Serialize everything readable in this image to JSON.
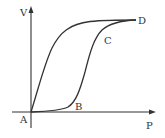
{
  "diagram": {
    "axes": {
      "x_label": "P",
      "y_label": "V"
    },
    "points": [
      {
        "label": "A",
        "role": "origin"
      },
      {
        "label": "B",
        "role": "lower curve knee"
      },
      {
        "label": "C",
        "role": "lower curve upper bend"
      },
      {
        "label": "D",
        "role": "meeting point of both curves"
      }
    ],
    "curves": [
      {
        "name": "upper",
        "path": [
          "A",
          "D"
        ],
        "description": "rises steeply from A then levels toward D"
      },
      {
        "name": "lower",
        "path": [
          "A",
          "B",
          "C",
          "D"
        ],
        "description": "flat along P axis to B, rises steeply, levels at C toward D"
      }
    ],
    "colors": {
      "ink": "#333333",
      "background": "#ffffff"
    }
  }
}
